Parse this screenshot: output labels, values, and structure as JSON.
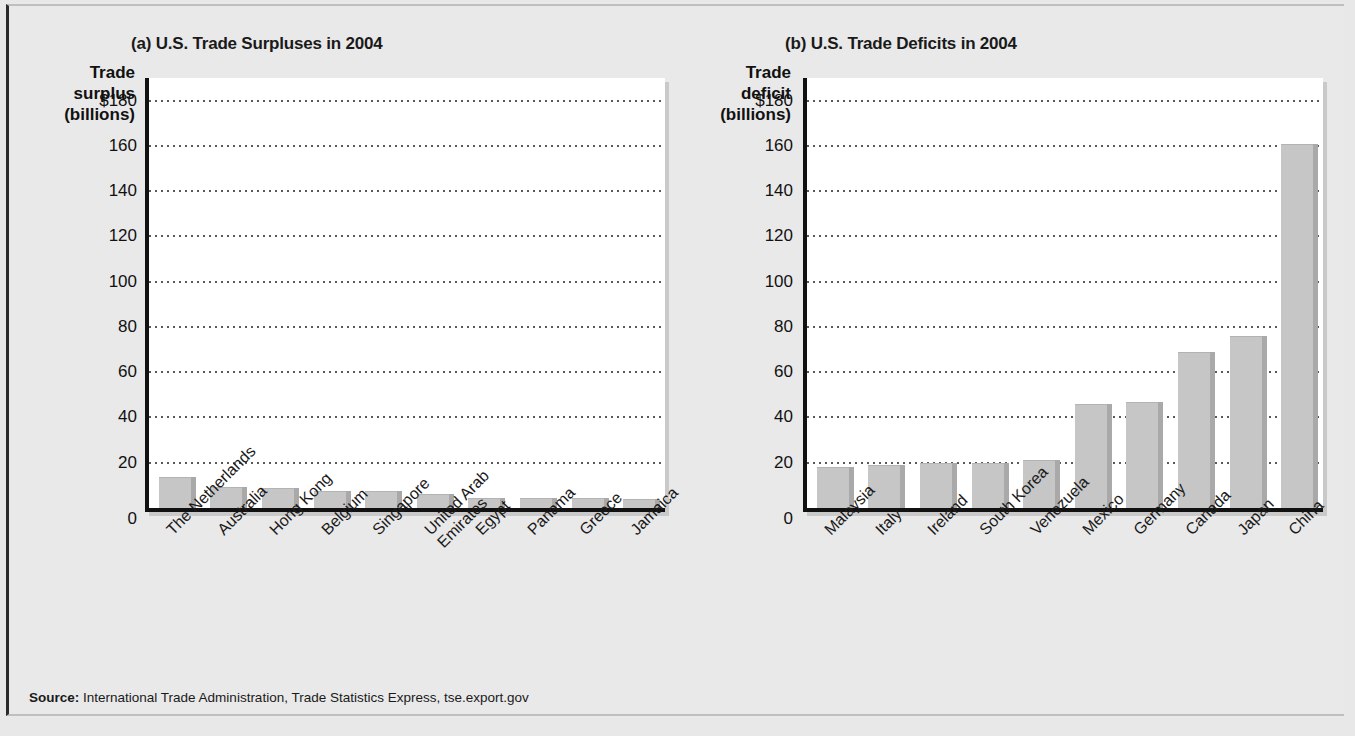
{
  "figure": {
    "source_prefix": "Source:",
    "source_text": "International Trade Administration, Trade Statistics Express, tse.export.gov",
    "background_color": "#e8e8e8",
    "bar_color": "#c6c6c6",
    "bar_edge_color": "#a9a9a9",
    "axis_color": "#111111"
  },
  "chart_data": [
    {
      "type": "bar",
      "title": "(a) U.S. Trade Surpluses in 2004",
      "ylabel": "Trade surplus (billions)",
      "ylabel_lines": [
        "Trade",
        "surplus",
        "(billions)"
      ],
      "xlabel": "",
      "ylim": [
        0,
        190
      ],
      "yticks": [
        0,
        20,
        40,
        60,
        80,
        100,
        120,
        140,
        160,
        180
      ],
      "ytick_labels": [
        "0",
        "20",
        "40",
        "60",
        "80",
        "100",
        "120",
        "140",
        "160",
        "$180"
      ],
      "grid": true,
      "legend": "none",
      "categories": [
        "The Netherlands",
        "Australia",
        "Hong Kong",
        "Belgium",
        "Singapore",
        "United Arab Emirates",
        "Egypt",
        "Panama",
        "Greece",
        "Jamaica"
      ],
      "values": [
        13.5,
        9.5,
        9,
        7.5,
        7.5,
        6,
        4.5,
        4.5,
        4.5,
        4
      ]
    },
    {
      "type": "bar",
      "title": "(b) U.S. Trade Deficits in 2004",
      "ylabel": "Trade deficit (billions)",
      "ylabel_lines": [
        "Trade",
        "deficit",
        "(billions)"
      ],
      "xlabel": "",
      "ylim": [
        0,
        190
      ],
      "yticks": [
        0,
        20,
        40,
        60,
        80,
        100,
        120,
        140,
        160,
        180
      ],
      "ytick_labels": [
        "0",
        "20",
        "40",
        "60",
        "80",
        "100",
        "120",
        "140",
        "160",
        "$180"
      ],
      "grid": true,
      "legend": "none",
      "categories": [
        "Malaysia",
        "Italy",
        "Ireland",
        "South Korea",
        "Venezuela",
        "Mexico",
        "Germany",
        "Canada",
        "Japan",
        "China"
      ],
      "values": [
        18,
        19,
        20,
        20,
        21,
        46,
        47,
        69,
        76,
        161
      ]
    }
  ]
}
